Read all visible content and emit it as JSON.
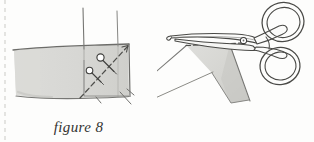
{
  "page": {
    "background_color": "#fdfdfc",
    "scan_artifact": "dashed-left-margin-line"
  },
  "figures": [
    {
      "id": "figure-8",
      "caption": "figure 8",
      "subject": "fabric-corner-with-pins-and-diagonal-cutting-line",
      "illustration_style": "pencil-sketch",
      "fabric_fill": "#d9d9d6",
      "fabric_edge_color": "#6f6f6c",
      "line_color": "#5a5a57",
      "elements": [
        "vertical-seam-line-left",
        "vertical-seam-line-right",
        "fabric-band",
        "folded-corner-square",
        "diagonal-dashed-line",
        "pin-upper",
        "pin-lower",
        "stitch-marks-bottom"
      ],
      "pin_count": 2
    },
    {
      "id": "figure-9",
      "caption": "figure 9",
      "subject": "scissors-cutting-folded-fabric-triangle-along-dashed-line",
      "illustration_style": "pencil-sketch",
      "fabric_fill": "#d9d9d6",
      "fabric_edge_color": "#6f6f6c",
      "line_color": "#5a5a57",
      "elements": [
        "scissors-upper-blade",
        "scissors-lower-blade",
        "scissors-pivot-screw",
        "scissors-handle-loop-upper",
        "scissors-handle-loop-lower",
        "fabric-triangle",
        "fold-line-left",
        "fold-line-right",
        "dashed-cut-line"
      ],
      "scissors_loop_count": 2
    }
  ],
  "colors": {
    "paper": "#fdfdfc",
    "graphite": "#5a5a57",
    "graphite_dark": "#3c3c3a",
    "fabric_grey": "#d9d9d6",
    "fabric_grey_shadow": "#c6c6c2",
    "caption_text": "#333331"
  }
}
